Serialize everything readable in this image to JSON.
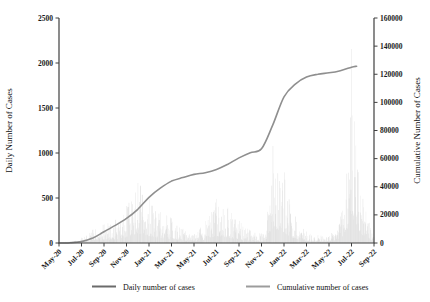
{
  "figure": {
    "width": 430,
    "height": 302,
    "background": "#ffffff"
  },
  "chart_data": {
    "type": "bar+line",
    "title": "",
    "x_axis": {
      "tick_labels": [
        "May-20",
        "Jul-20",
        "Sep-20",
        "Nov-20",
        "Jan-21",
        "Mar-21",
        "May-21",
        "Jul-21",
        "Sep-21",
        "Nov-21",
        "Jan-22",
        "Mar-22",
        "May-22",
        "Jul-22",
        "Sep-22"
      ],
      "months_span": 28
    },
    "left_axis": {
      "label": "Daily Number of Cases",
      "min": 0,
      "max": 2500,
      "tick_step": 500,
      "tick_labels": [
        "0",
        "500",
        "1000",
        "1500",
        "2000",
        "2500"
      ]
    },
    "right_axis": {
      "label": "Cumulative Number of Cases",
      "min": 0,
      "max": 160000,
      "tick_step": 20000,
      "tick_labels": [
        "0",
        "20000",
        "40000",
        "60000",
        "80000",
        "100000",
        "120000",
        "140000",
        "160000"
      ]
    },
    "months": [
      "May-20",
      "Jun-20",
      "Jul-20",
      "Aug-20",
      "Sep-20",
      "Oct-20",
      "Nov-20",
      "Dec-20",
      "Jan-21",
      "Feb-21",
      "Mar-21",
      "Apr-21",
      "May-21",
      "Jun-21",
      "Jul-21",
      "Aug-21",
      "Sep-21",
      "Oct-21",
      "Nov-21",
      "Dec-21",
      "Jan-22",
      "Feb-22",
      "Mar-22",
      "Apr-22",
      "May-22",
      "Jun-22",
      "Jul-22",
      "Aug-22",
      "Sep-22"
    ],
    "series": [
      {
        "name": "Daily number of cases",
        "type": "bar",
        "color": "#d6d6d6",
        "monthly_peak_values": [
          5,
          20,
          60,
          150,
          210,
          260,
          420,
          680,
          500,
          350,
          280,
          160,
          100,
          250,
          500,
          400,
          250,
          140,
          110,
          1100,
          800,
          300,
          130,
          90,
          80,
          300,
          2200,
          500,
          130
        ]
      },
      {
        "name": "Cumulative number of cases",
        "type": "line",
        "color": "#8f8f8f",
        "monthly_values": [
          0,
          200,
          1000,
          3500,
          8000,
          12500,
          17500,
          24000,
          32500,
          39000,
          44000,
          46500,
          48800,
          50000,
          52300,
          56000,
          60500,
          64200,
          67000,
          84000,
          104000,
          113000,
          118000,
          120000,
          121000,
          122500,
          125000
        ]
      }
    ],
    "legend": {
      "position": "bottom",
      "entries": [
        {
          "label": "Daily number of cases",
          "color": "#6b6b6b"
        },
        {
          "label": "Cumulative number of cases",
          "color": "#9c9c9c"
        }
      ]
    },
    "axis_color": "#404040"
  }
}
